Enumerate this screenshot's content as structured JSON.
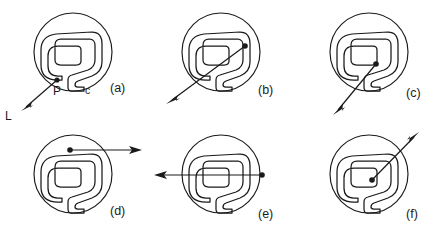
{
  "figure": {
    "kind": "diagram",
    "stroke_color": "#1a1a1a",
    "background_color": "#ffffff"
  },
  "labels": {
    "point": "P",
    "curve": "c",
    "ray": "L"
  },
  "panels": [
    {
      "id": "a",
      "label": "(a)",
      "label_x": 115,
      "label_y": 88,
      "circle": {
        "cx": 73,
        "cy": 52,
        "r": 39
      },
      "point": {
        "x": 57,
        "y": 80
      },
      "point_label": "P",
      "point_label_x": 58,
      "point_label_y": 94,
      "curve_label": "c",
      "curve_label_x": 87,
      "curve_label_y": 90,
      "ray_label": "L",
      "ray_label_x": 7,
      "ray_label_y": 120,
      "ray": {
        "x1": 57,
        "y1": 80,
        "x2": 22,
        "y2": 111
      },
      "ray_direction": "down-left"
    },
    {
      "id": "b",
      "label": "(b)",
      "label_x": 263,
      "label_y": 90,
      "circle": {
        "cx": 221,
        "cy": 52,
        "r": 39
      },
      "point": {
        "x": 245,
        "y": 46
      },
      "ray": {
        "x1": 245,
        "y1": 46,
        "x2": 167,
        "y2": 104
      },
      "ray_direction": "down-left"
    },
    {
      "id": "c",
      "label": "(c)",
      "label_x": 411,
      "label_y": 93,
      "circle": {
        "cx": 369,
        "cy": 52,
        "r": 39
      },
      "point": {
        "x": 376,
        "y": 64
      },
      "ray": {
        "x1": 376,
        "y1": 64,
        "x2": 333,
        "y2": 116
      },
      "ray_direction": "down-left"
    },
    {
      "id": "d",
      "label": "(d)",
      "label_x": 115,
      "label_y": 211,
      "circle": {
        "cx": 73,
        "cy": 174,
        "r": 39
      },
      "point": {
        "x": 70,
        "y": 150
      },
      "ray": {
        "x1": 70,
        "y1": 150,
        "x2": 140,
        "y2": 150
      },
      "ray_direction": "right"
    },
    {
      "id": "e",
      "label": "(e)",
      "label_x": 263,
      "label_y": 214,
      "circle": {
        "cx": 221,
        "cy": 174,
        "r": 39
      },
      "point": {
        "x": 262,
        "y": 175
      },
      "ray": {
        "x1": 262,
        "y1": 175,
        "x2": 155,
        "y2": 175
      },
      "ray_direction": "left"
    },
    {
      "id": "f",
      "label": "(f)",
      "label_x": 411,
      "label_y": 214,
      "circle": {
        "cx": 369,
        "cy": 174,
        "r": 39
      },
      "point": {
        "x": 372,
        "y": 180
      },
      "ray": {
        "x1": 372,
        "y1": 180,
        "x2": 419,
        "y2": 132
      },
      "ray_direction": "up-right"
    }
  ]
}
